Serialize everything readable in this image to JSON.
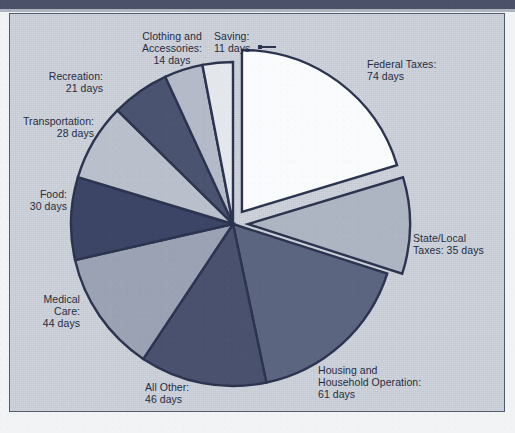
{
  "figure": {
    "background_color": "#ccd1da",
    "frame_color": "#515a6e",
    "outline_color": "#2c3450",
    "text_color": "#262d3f"
  },
  "chart_data": {
    "type": "pie",
    "title": "",
    "subtitle": "",
    "unit": "days",
    "total_days": 364,
    "start_angle_deg": 0,
    "direction": "clockwise",
    "legend": "none (direct labels with leader lines)",
    "grid": false,
    "categories": [
      "Federal Taxes",
      "State/Local Taxes",
      "Housing and Household Operation",
      "All Other",
      "Medical Care",
      "Food",
      "Transportation",
      "Recreation",
      "Clothing and Accessories",
      "Saving"
    ],
    "values": [
      74,
      35,
      61,
      46,
      44,
      30,
      28,
      21,
      14,
      11
    ],
    "slices": [
      {
        "name": "Federal Taxes",
        "label": "Federal Taxes:\n74 days",
        "value": 74,
        "unit": "days",
        "percent": 20.3,
        "color": "#fafbfc",
        "exploded": true,
        "label_position": "right"
      },
      {
        "name": "State/Local Taxes",
        "label": "State/Local\nTaxes: 35 days",
        "value": 35,
        "unit": "days",
        "percent": 9.6,
        "color": "#adb4c2",
        "exploded": true,
        "label_position": "right"
      },
      {
        "name": "Housing and Household Operation",
        "label": "Housing and\nHousehold Operation:\n61 days",
        "value": 61,
        "unit": "days",
        "percent": 16.8,
        "color": "#5b6580",
        "exploded": false,
        "label_position": "bottom-right"
      },
      {
        "name": "All Other",
        "label": "All Other:\n46 days",
        "value": 46,
        "unit": "days",
        "percent": 12.6,
        "color": "#49516e",
        "exploded": false,
        "label_position": "bottom"
      },
      {
        "name": "Medical Care",
        "label": "Medical\nCare:\n44 days",
        "value": 44,
        "unit": "days",
        "percent": 12.1,
        "color": "#9aa2b3",
        "exploded": false,
        "label_position": "left"
      },
      {
        "name": "Food",
        "label": "Food:\n30 days",
        "value": 30,
        "unit": "days",
        "percent": 8.2,
        "color": "#3c4566",
        "exploded": false,
        "label_position": "left"
      },
      {
        "name": "Transportation",
        "label": "Transportation:\n28 days",
        "value": 28,
        "unit": "days",
        "percent": 7.7,
        "color": "#b9bfcb",
        "exploded": false,
        "label_position": "left"
      },
      {
        "name": "Recreation",
        "label": "Recreation:\n21 days",
        "value": 21,
        "unit": "days",
        "percent": 5.8,
        "color": "#4a5370",
        "exploded": false,
        "label_position": "upper-left"
      },
      {
        "name": "Clothing and Accessories",
        "label": "Clothing and\nAccessories:\n14 days",
        "value": 14,
        "unit": "days",
        "percent": 3.8,
        "color": "#b4bac7",
        "exploded": false,
        "label_position": "top"
      },
      {
        "name": "Saving",
        "label": "Saving:\n11 days",
        "value": 11,
        "unit": "days",
        "percent": 3.0,
        "color": "#e4e7ec",
        "exploded": false,
        "label_position": "top-right"
      }
    ]
  }
}
